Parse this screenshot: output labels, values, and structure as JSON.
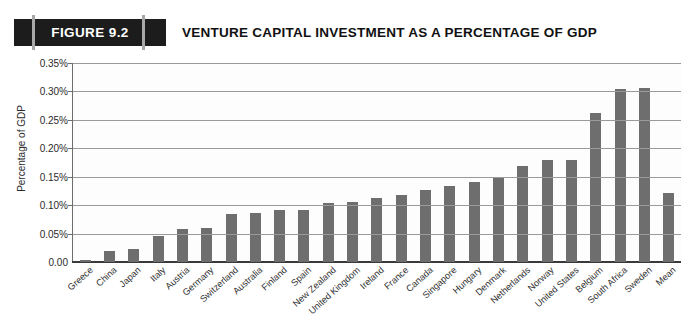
{
  "header": {
    "figure_label": "FIGURE 9.2",
    "title": "VENTURE CAPITAL INVESTMENT AS A PERCENTAGE OF GDP"
  },
  "colors": {
    "bar": "#6e6e6e",
    "badge": "#1c1c1c",
    "gridline": "#9a9a9a",
    "axis": "#3a3a3a"
  },
  "chart_data": {
    "type": "bar",
    "title": "VENTURE CAPITAL INVESTMENT AS A PERCENTAGE OF GDP",
    "xlabel": "",
    "ylabel": "Percentage of GDP",
    "ylim": [
      0,
      0.35
    ],
    "grid": true,
    "legend": "none",
    "ytick_labels": [
      "0.35%",
      "0.30%",
      "0.25%",
      "0.20%",
      "0.15%",
      "0.10%",
      "0.05%",
      "0.00"
    ],
    "ytick_values": [
      0.35,
      0.3,
      0.25,
      0.2,
      0.15,
      0.1,
      0.05,
      0.0
    ],
    "categories": [
      "Greece",
      "China",
      "Japan",
      "Italy",
      "Austria",
      "Germany",
      "Switzerland",
      "Australia",
      "Finland",
      "Spain",
      "New Zealand",
      "United Kingdom",
      "Ireland",
      "France",
      "Canada",
      "Singapore",
      "Hungary",
      "Denmark",
      "Netherlands",
      "Norway",
      "United States",
      "Belgium",
      "South Africa",
      "Sweden",
      "Mean"
    ],
    "values": [
      0.004,
      0.019,
      0.023,
      0.046,
      0.058,
      0.06,
      0.085,
      0.086,
      0.091,
      0.092,
      0.104,
      0.105,
      0.112,
      0.118,
      0.126,
      0.134,
      0.14,
      0.147,
      0.168,
      0.179,
      0.18,
      0.262,
      0.305,
      0.306,
      0.121
    ]
  }
}
